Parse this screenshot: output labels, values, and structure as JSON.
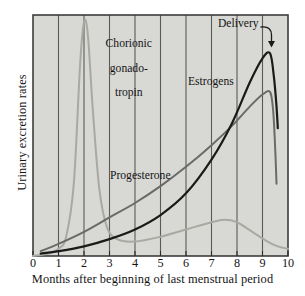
{
  "figure": {
    "name": "hormone-excretion-during-pregnancy-chart",
    "background_color": "#ffffff",
    "plot_background_color": "#d8d8d4",
    "frame_color": "#3d3d3d",
    "gridline_color": "#5a5a5a"
  },
  "chart_data": {
    "type": "line",
    "title": "",
    "xlabel": "Months after beginning of last menstrual period",
    "ylabel": "Urinary excretion rates",
    "xlim": [
      0,
      10
    ],
    "ylim": [
      0,
      100
    ],
    "xticks": [
      "0",
      "1",
      "2",
      "3",
      "4",
      "5",
      "6",
      "7",
      "8",
      "9",
      "10"
    ],
    "yticks": [],
    "grid": "vertical",
    "legend": "inline-labels",
    "annotations": [
      {
        "name": "delivery-annotation",
        "label": "Delivery",
        "x": 9.3,
        "note": "curved arrow pointing down to the sharp drop of the curves at delivery"
      }
    ],
    "series": [
      {
        "name": "Chorionic gonadotropin",
        "label": "Chorionic\ngonado-\ntropin",
        "color": "#a9a9a4",
        "line_width": 2.0,
        "points": [
          [
            0.0,
            0
          ],
          [
            0.6,
            1
          ],
          [
            1.0,
            3
          ],
          [
            1.3,
            8
          ],
          [
            1.6,
            30
          ],
          [
            1.85,
            80
          ],
          [
            2.0,
            97
          ],
          [
            2.15,
            92
          ],
          [
            2.35,
            60
          ],
          [
            2.6,
            28
          ],
          [
            2.9,
            12
          ],
          [
            3.3,
            7
          ],
          [
            4.0,
            6
          ],
          [
            5.0,
            8
          ],
          [
            6.0,
            11
          ],
          [
            7.0,
            14
          ],
          [
            7.5,
            15
          ],
          [
            8.0,
            14
          ],
          [
            8.6,
            10
          ],
          [
            9.2,
            6
          ],
          [
            9.6,
            4
          ],
          [
            10.0,
            3
          ]
        ]
      },
      {
        "name": "Progesterone",
        "label": "Progesterone",
        "color": "#6a6a6a",
        "line_width": 2.0,
        "points": [
          [
            0.3,
            2
          ],
          [
            1.0,
            5
          ],
          [
            2.0,
            10
          ],
          [
            3.0,
            16
          ],
          [
            4.0,
            22
          ],
          [
            5.0,
            29
          ],
          [
            6.0,
            37
          ],
          [
            7.0,
            46
          ],
          [
            7.8,
            54
          ],
          [
            8.5,
            62
          ],
          [
            9.0,
            67
          ],
          [
            9.3,
            68
          ],
          [
            9.42,
            60
          ],
          [
            9.5,
            44
          ],
          [
            9.55,
            30
          ]
        ]
      },
      {
        "name": "Estrogens",
        "label": "Estrogens",
        "color": "#1a1a1a",
        "line_width": 2.2,
        "points": [
          [
            0.3,
            1
          ],
          [
            1.0,
            2
          ],
          [
            2.0,
            4
          ],
          [
            3.0,
            7
          ],
          [
            4.0,
            11
          ],
          [
            5.0,
            17
          ],
          [
            6.0,
            26
          ],
          [
            7.0,
            40
          ],
          [
            7.8,
            55
          ],
          [
            8.5,
            72
          ],
          [
            9.0,
            82
          ],
          [
            9.3,
            84
          ],
          [
            9.45,
            74
          ],
          [
            9.55,
            62
          ],
          [
            9.6,
            53
          ]
        ]
      }
    ]
  },
  "labels": {
    "ylabel": "Urinary excretion rates",
    "xlabel": "Months after beginning of last menstrual period",
    "chorionic_gonadotropin_line1": "Chorionic",
    "chorionic_gonadotropin_line2": "gonado-",
    "chorionic_gonadotropin_line3": "tropin",
    "estrogens": "Estrogens",
    "progesterone": "Progesterone",
    "delivery": "Delivery"
  },
  "xticks": {
    "t0": "0",
    "t1": "1",
    "t2": "2",
    "t3": "3",
    "t4": "4",
    "t5": "5",
    "t6": "6",
    "t7": "7",
    "t8": "8",
    "t9": "9",
    "t10": "10"
  }
}
